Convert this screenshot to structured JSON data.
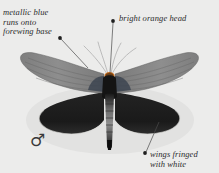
{
  "plate": {
    "subject": "moth specimen",
    "background_color": "#ececeb",
    "annotations": [
      {
        "id": "metallic-blue",
        "text": "metallic blue\nruns onto\nforewing base",
        "dot": {
          "x": 60,
          "y": 38
        },
        "target": {
          "x": 88,
          "y": 68
        }
      },
      {
        "id": "orange-head",
        "text": "bright orange head",
        "dot": {
          "x": 113,
          "y": 21
        },
        "target": {
          "x": 110,
          "y": 74
        }
      },
      {
        "id": "white-fringe",
        "text": "wings fringed\nwith white",
        "dot": {
          "x": 145,
          "y": 153
        },
        "target": {
          "x": 159,
          "y": 122
        }
      }
    ],
    "sex_symbol": "♂",
    "colors": {
      "forewing": "#8a8a8a",
      "forewing_dark": "#6f6f6f",
      "hindwing": "#1e1e1e",
      "body": "#141414",
      "abdomen_band": "#9a9a9a",
      "antenna": "#b9b9b9",
      "leader_line": "#4a4a4a",
      "text": "#2b2b2b",
      "background": "#ececeb"
    }
  }
}
